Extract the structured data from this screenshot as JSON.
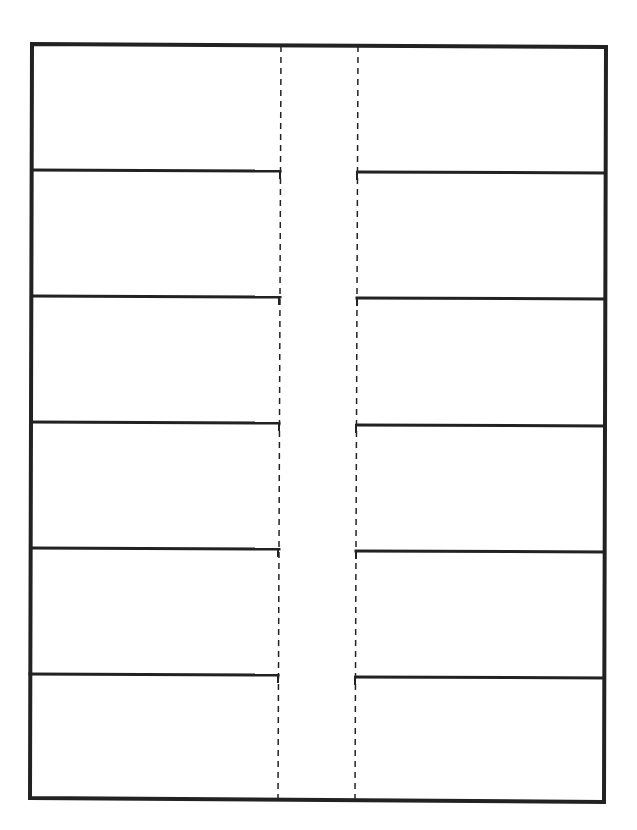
{
  "template": {
    "type": "foldable-flap-sheet",
    "flaps_per_side": 6,
    "sides": [
      "left",
      "right"
    ],
    "fold_lines": 2,
    "text": []
  },
  "colors": {
    "line": "#222222",
    "background": "#ffffff"
  },
  "geometry": {
    "outer": {
      "tl": [
        32,
        44
      ],
      "tr": [
        606,
        47
      ],
      "br": [
        604,
        802
      ],
      "bl": [
        30,
        798
      ]
    },
    "fold_left_x_top": 281,
    "fold_left_x_bottom": 278,
    "fold_right_x_top": 358,
    "fold_right_x_bottom": 355,
    "left_cut_y": [
      170,
      296,
      422,
      548,
      674
    ],
    "right_cut_y": [
      172,
      298,
      425,
      551,
      677
    ]
  }
}
